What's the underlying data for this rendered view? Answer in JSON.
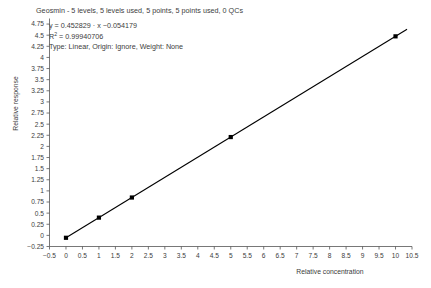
{
  "chart_title": "Geosmin - 5 levels, 5 levels used, 5 points, 5 points used, 0 QCs",
  "annotation": {
    "equation_prefix": "y = 0.452829 · ",
    "equation_x": "x",
    "equation_suffix": " −0.054179",
    "r_squared_prefix": "R",
    "r_squared_sup": "2",
    "r_squared_value": " = 0.99940706",
    "fit_info": "Type: Linear, Origin: Ignore, Weight: None"
  },
  "axes": {
    "x_title": "Relative concentration",
    "y_title": "Relative response"
  },
  "chart_data": {
    "type": "scatter",
    "title": "Geosmin - 5 levels, 5 levels used, 5 points, 5 points used, 0 QCs",
    "xlabel": "Relative concentration",
    "ylabel": "Relative response",
    "xlim": [
      -0.5,
      10.5
    ],
    "ylim": [
      -0.25,
      4.875
    ],
    "grid": false,
    "legend": "none",
    "x_ticks": [
      -0.5,
      0,
      0.5,
      1,
      1.5,
      2,
      2.5,
      3,
      3.5,
      4,
      4.5,
      5,
      5.5,
      6,
      6.5,
      7,
      7.5,
      8,
      8.5,
      9,
      9.5,
      10,
      10.5
    ],
    "x_tick_labels": [
      "−0.5",
      "0",
      "0.5",
      "1",
      "1.5",
      "2",
      "2.5",
      "3",
      "3.5",
      "4",
      "4.5",
      "5",
      "5.5",
      "6",
      "6.5",
      "7",
      "7.5",
      "8",
      "8.5",
      "9",
      "9.5",
      "10",
      "10.5"
    ],
    "y_ticks": [
      -0.25,
      0,
      0.25,
      0.5,
      0.75,
      1,
      1.25,
      1.5,
      1.75,
      2,
      2.25,
      2.5,
      2.75,
      3,
      3.25,
      3.5,
      3.75,
      4,
      4.25,
      4.5,
      4.75
    ],
    "y_tick_labels": [
      "−0.25",
      "0",
      "0.25",
      "0.5",
      "0.75",
      "1",
      "1.25",
      "1.5",
      "1.75",
      "2",
      "2.25",
      "2.5",
      "2.75",
      "3",
      "3.25",
      "3.5",
      "3.75",
      "4",
      "4.25",
      "4.5",
      "4.75"
    ],
    "series": [
      {
        "name": "Calibration points",
        "marker": "square",
        "color": "#000000",
        "x": [
          0,
          1,
          2,
          5,
          10
        ],
        "y": [
          -0.054,
          0.399,
          0.851,
          2.21,
          4.474
        ]
      }
    ],
    "fit": {
      "type": "linear",
      "slope": 0.452829,
      "intercept": -0.054179,
      "r_squared": 0.99940706,
      "origin": "Ignore",
      "weight": "None",
      "color": "#000000",
      "x_start": 0,
      "x_end": 10.35
    }
  }
}
